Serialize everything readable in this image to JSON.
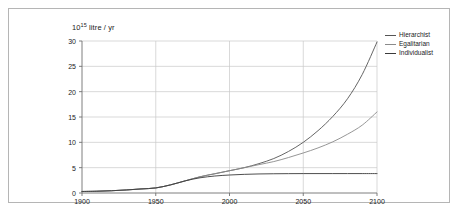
{
  "chart_data": {
    "type": "line",
    "title": "",
    "subtitle": "",
    "xlabel": "",
    "ylabel": "10^15 litre / yr",
    "ylabel_mantissa": "10",
    "ylabel_exponent": "15",
    "ylabel_unit": "litre / yr",
    "xlim": [
      1900,
      2100
    ],
    "ylim": [
      0,
      30
    ],
    "xticks": [
      1900,
      1950,
      2000,
      2050,
      2100
    ],
    "yticks": [
      0,
      5,
      10,
      15,
      20,
      25,
      30
    ],
    "grid": true,
    "legend_position": "outside-top-right",
    "x": [
      1900,
      1910,
      1920,
      1930,
      1940,
      1950,
      1960,
      1970,
      1980,
      1990,
      2000,
      2010,
      2020,
      2030,
      2040,
      2050,
      2060,
      2070,
      2080,
      2090,
      2100
    ],
    "series": [
      {
        "name": "Hierarchist",
        "color": "#555555",
        "values": [
          0.3,
          0.35,
          0.45,
          0.6,
          0.8,
          1.0,
          1.6,
          2.4,
          3.2,
          3.8,
          4.4,
          5.0,
          5.8,
          6.8,
          8.2,
          10.0,
          12.3,
          15.1,
          18.6,
          23.4,
          29.8
        ]
      },
      {
        "name": "Egalitarian",
        "color": "#8a8a8a",
        "values": [
          0.3,
          0.35,
          0.45,
          0.6,
          0.8,
          1.0,
          1.6,
          2.4,
          3.2,
          3.8,
          4.4,
          5.0,
          5.6,
          6.2,
          7.0,
          7.9,
          8.9,
          10.1,
          11.6,
          13.4,
          16.0
        ]
      },
      {
        "name": "Individualist",
        "color": "#3a3a3a",
        "values": [
          0.3,
          0.35,
          0.45,
          0.6,
          0.8,
          1.0,
          1.6,
          2.4,
          3.0,
          3.35,
          3.55,
          3.68,
          3.76,
          3.8,
          3.82,
          3.83,
          3.83,
          3.83,
          3.83,
          3.83,
          3.83
        ]
      }
    ],
    "legend": [
      "Hierarchist",
      "Egalitarian",
      "Individualist"
    ]
  },
  "axes": {
    "ytick_labels": [
      "30",
      "25",
      "20",
      "15",
      "10",
      "5",
      "0"
    ],
    "xtick_labels": [
      "1900",
      "1950",
      "2000",
      "2050",
      "2100"
    ]
  },
  "colors": {
    "frame_border": "#b5b5b5",
    "grid": "#c9c9c9",
    "axis": "#6f6f6f",
    "background": "#ffffff"
  }
}
